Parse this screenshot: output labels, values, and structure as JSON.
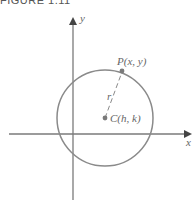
{
  "figure": {
    "caption": "FIGURE 1.11"
  },
  "axes": {
    "x_label": "x",
    "y_label": "y"
  },
  "points": {
    "P": {
      "label": "P(x, y)"
    },
    "C": {
      "label": "C(h, k)"
    }
  },
  "radius_label": "r",
  "colors": {
    "axis": "#7a7a7a",
    "circle": "#8a8a8a",
    "text": "#666666"
  }
}
